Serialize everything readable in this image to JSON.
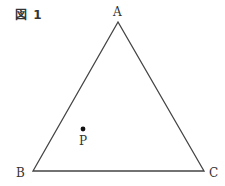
{
  "figure": {
    "label": "図 1"
  },
  "triangle": {
    "vertices": {
      "A": {
        "label": "A",
        "x": 118,
        "y": 22
      },
      "B": {
        "label": "B",
        "x": 33,
        "y": 171
      },
      "C": {
        "label": "C",
        "x": 204,
        "y": 171
      }
    },
    "stroke": "#444444"
  },
  "point": {
    "label": "P",
    "x": 83,
    "y": 129,
    "color": "#111111"
  }
}
